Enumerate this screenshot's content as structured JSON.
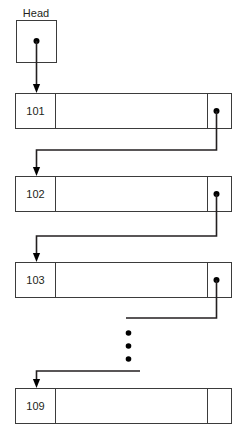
{
  "diagram": {
    "type": "linked-list",
    "title_label": "Head",
    "head": {
      "label": "Head",
      "pointer_dot": true
    },
    "nodes": [
      {
        "id": "101",
        "label": "101",
        "has_next_pointer": true
      },
      {
        "id": "102",
        "label": "102",
        "has_next_pointer": true
      },
      {
        "id": "103",
        "label": "103",
        "has_next_pointer": true
      },
      {
        "id": "109",
        "label": "109",
        "has_next_pointer": false
      }
    ],
    "ellipsis": {
      "symbol": "•",
      "count": 3,
      "orientation": "vertical",
      "meaning": "omitted nodes"
    },
    "colors": {
      "stroke": "#3b3b3b",
      "connector": "#231f20",
      "text": "#231f20",
      "background": "#ffffff",
      "dot": "#000000"
    }
  }
}
